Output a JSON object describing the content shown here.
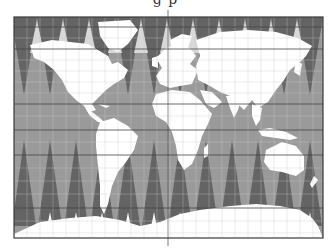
{
  "title_fragment": "g      p",
  "map": {
    "projection_hint": "interrupted gore map (world)",
    "bounds": {
      "x": 14,
      "y": 17,
      "width": 309,
      "height": 221
    },
    "colors": {
      "ocean": "#9a9a9a",
      "dark_gore": "#646464",
      "land": "#ffffff",
      "grid_light": "#c8c8c8",
      "grid_dark": "#444444",
      "border": "#3a3a3a",
      "background": "#ffffff"
    },
    "gore_count": 12,
    "gore_width": 26,
    "dark_parallels_y": [
      27,
      49,
      104,
      130,
      155,
      208
    ],
    "light_parallels_y": [
      38,
      60,
      71,
      82,
      93,
      116,
      142,
      168,
      181,
      194,
      221,
      233
    ],
    "central_meridian_x": 168,
    "continents": [
      "North America",
      "South America",
      "Europe",
      "Africa",
      "Asia",
      "Australia",
      "Antarctica",
      "Greenland"
    ]
  }
}
